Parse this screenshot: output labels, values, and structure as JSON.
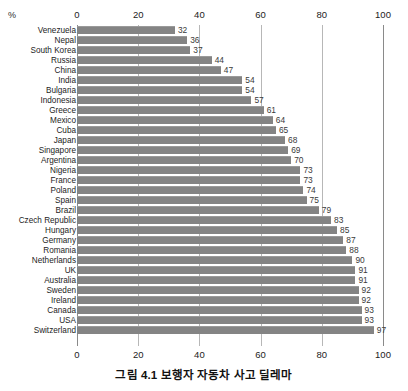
{
  "chart_data": {
    "type": "bar",
    "orientation": "horizontal",
    "title": "",
    "unit_label": "%",
    "xlabel": "",
    "ylabel": "",
    "xlim": [
      0,
      100
    ],
    "xticks": [
      0,
      20,
      40,
      60,
      80,
      100
    ],
    "grid": true,
    "legend": null,
    "bar_color": "#848484",
    "categories": [
      "Venezuela",
      "Nepal",
      "South Korea",
      "Russia",
      "China",
      "India",
      "Bulgaria",
      "Indonesia",
      "Greece",
      "Mexico",
      "Cuba",
      "Japan",
      "Singapore",
      "Argentina",
      "Nigeria",
      "France",
      "Poland",
      "Spain",
      "Brazil",
      "Czech Republic",
      "Hungary",
      "Germany",
      "Romania",
      "Netherlands",
      "UK",
      "Australia",
      "Sweden",
      "Ireland",
      "Canada",
      "USA",
      "Switzerland"
    ],
    "values": [
      32,
      36,
      37,
      44,
      47,
      54,
      54,
      57,
      61,
      64,
      65,
      68,
      69,
      70,
      73,
      73,
      74,
      75,
      79,
      83,
      85,
      87,
      88,
      90,
      91,
      91,
      92,
      92,
      93,
      93,
      97
    ]
  },
  "caption": {
    "text": "그림 4.1 보행자 자동차 사고 딜레마"
  }
}
